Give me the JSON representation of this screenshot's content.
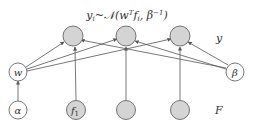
{
  "equation": "yᵢ~𝒩(wᵀfᵢ, β⁻¹)",
  "equation_parts": {
    "y": "y",
    "sub_i": "i",
    "tilde": "~",
    "N": "𝒩",
    "open": "(w",
    "T": "T",
    "f": "f",
    "sub_i2": "i",
    "rest": ", β",
    "inv": "−1",
    "close": ")"
  },
  "labels": {
    "y_layer": "y",
    "F_layer": "F"
  },
  "nodes": {
    "w": "w",
    "beta": "β",
    "alpha": "α",
    "f1": "f",
    "f1_sub": "1"
  },
  "colors": {
    "observed_fill": "#d4d4d4",
    "stroke": "#555555",
    "edge": "#555555"
  }
}
